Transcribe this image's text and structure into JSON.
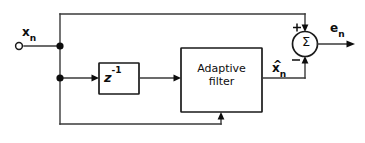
{
  "diagram": {
    "type": "signal-flow-block-diagram",
    "colors": {
      "line": "#3a3a3a",
      "line_dark": "#1a1a1a",
      "ink": "#0d0d0d",
      "background": "#ffffff"
    },
    "input_terminal": {
      "symbol_base": "x",
      "symbol_subscript": "n",
      "description": "input signal terminal"
    },
    "delay_block": {
      "symbol_base": "z",
      "symbol_superscript": "-1",
      "description": "unit delay element"
    },
    "filter_block": {
      "line1": "Adaptive",
      "line2": "filter",
      "description": "adaptive filter block"
    },
    "estimate_signal": {
      "symbol_base": "x",
      "symbol_subscript": "n",
      "accent": "^",
      "description": "filter output estimate x-hat sub n"
    },
    "summing_node": {
      "symbol": "Σ",
      "plus_sign": "+",
      "minus_sign": "−",
      "description": "summing junction"
    },
    "error_output": {
      "symbol_base": "e",
      "symbol_subscript": "n",
      "description": "error output signal"
    }
  }
}
